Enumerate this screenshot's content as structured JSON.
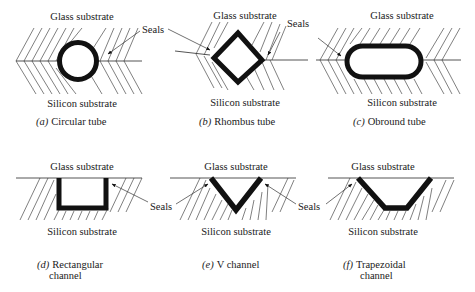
{
  "figure": {
    "panels": [
      {
        "id": "a",
        "letter": "(a)",
        "title": "Circular tube",
        "top_label": "Glass substrate",
        "bottom_label": "Silicon substrate",
        "shape": "circle"
      },
      {
        "id": "b",
        "letter": "(b)",
        "title": "Rhombus tube",
        "top_label": "Glass substrate",
        "bottom_label": "Silicon substrate",
        "shape": "rhombus"
      },
      {
        "id": "c",
        "letter": "(c)",
        "title": "Obround tube",
        "top_label": "Glass substrate",
        "bottom_label": "Silicon substrate",
        "shape": "obround"
      },
      {
        "id": "d",
        "letter": "(d)",
        "title": "Rectangular",
        "title_line2": "channel",
        "top_label": "Glass substrate",
        "bottom_label": "Silicon substrate",
        "shape": "rectangular-channel"
      },
      {
        "id": "e",
        "letter": "(e)",
        "title": "V channel",
        "top_label": "Glass substrate",
        "bottom_label": "Silicon substrate",
        "shape": "v-channel"
      },
      {
        "id": "f",
        "letter": "(f)",
        "title": "Trapezoidal",
        "title_line2": "channel",
        "top_label": "Glass substrate",
        "bottom_label": "Silicon substrate",
        "shape": "trapezoidal-channel"
      }
    ],
    "callouts": [
      {
        "text": "Seals",
        "near": "a"
      },
      {
        "text": "Seals",
        "near": "b"
      },
      {
        "text": "Seals",
        "near": "d-e"
      },
      {
        "text": "Seals",
        "near": "e-f"
      }
    ],
    "colors": {
      "background": "#ffffff",
      "ink": "#111111"
    }
  }
}
